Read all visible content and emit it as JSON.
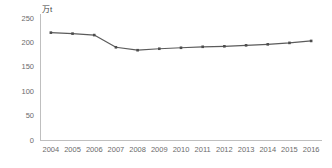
{
  "chart_data": {
    "type": "line",
    "title": "",
    "xlabel": "",
    "ylabel": "万t",
    "ylim": [
      0,
      250
    ],
    "yticks": [
      0,
      50,
      100,
      150,
      200,
      250
    ],
    "grid": false,
    "legend": "none",
    "line_color": "#5b5b5b",
    "marker_color": "#4d4d4d",
    "axis_color": "#bfbfbf",
    "categories": [
      "2004",
      "2005",
      "2006",
      "2007",
      "2008",
      "2009",
      "2010",
      "2011",
      "2012",
      "2013",
      "2014",
      "2015",
      "2016"
    ],
    "values": [
      220,
      218,
      215,
      190,
      184,
      187,
      189,
      191,
      192,
      194,
      196,
      199,
      203
    ]
  }
}
